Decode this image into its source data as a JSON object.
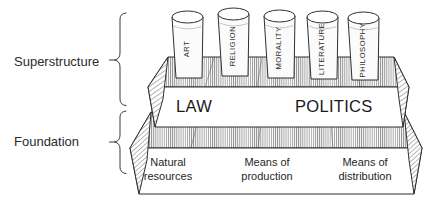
{
  "diagram": {
    "side_labels": [
      {
        "id": "superstructure",
        "text": "Superstructure"
      },
      {
        "id": "foundation",
        "text": "Foundation"
      }
    ],
    "superstructure": {
      "pillars": [
        {
          "id": "art",
          "label": "ART"
        },
        {
          "id": "religion",
          "label": "RELIGION"
        },
        {
          "id": "morality",
          "label": "MORALITY"
        },
        {
          "id": "literature",
          "label": "LITERATURE"
        },
        {
          "id": "philosophy",
          "label": "PHILOSOPHY"
        }
      ],
      "slab_labels": [
        {
          "id": "law",
          "text": "LAW"
        },
        {
          "id": "politics",
          "text": "POLITICS"
        }
      ]
    },
    "foundation": {
      "segments": [
        {
          "id": "natural-resources",
          "line1": "Natural",
          "line2": "resources"
        },
        {
          "id": "means-of-production",
          "line1": "Means of",
          "line2": "production"
        },
        {
          "id": "means-of-distribution",
          "line1": "Means of",
          "line2": "distribution"
        }
      ]
    },
    "colors": {
      "ink": "#2f2f2f",
      "text": "#1f1f1f",
      "paper": "#ffffff",
      "hatch": "#555555"
    }
  }
}
